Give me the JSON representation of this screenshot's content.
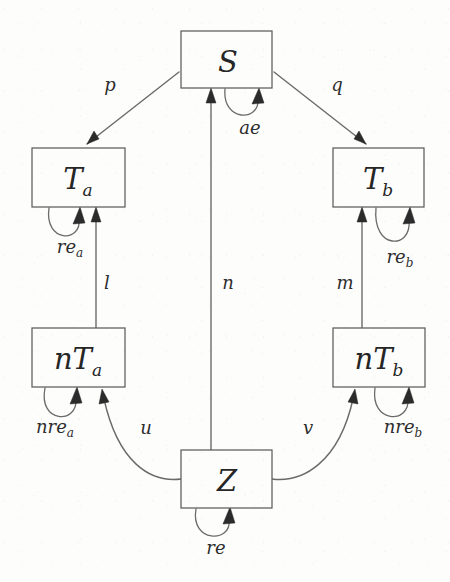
{
  "figure": {
    "kind": "state-transition-diagram",
    "background_color": "#fdfdfc",
    "line_color": "#6a6a6a",
    "arrow_color": "#2b2b2b",
    "text_color": "#262626",
    "width": 450,
    "height": 582
  },
  "nodes": [
    {
      "id": "S",
      "main": "S",
      "sub": "",
      "x": 181,
      "y": 31,
      "w": 91,
      "h": 57
    },
    {
      "id": "Ta",
      "main": "T",
      "sub": "a",
      "x": 32,
      "y": 148,
      "w": 93,
      "h": 59
    },
    {
      "id": "Tb",
      "main": "T",
      "sub": "b",
      "x": 333,
      "y": 148,
      "w": 91,
      "h": 59
    },
    {
      "id": "nTa",
      "main": "nT",
      "sub": "a",
      "x": 32,
      "y": 328,
      "w": 93,
      "h": 59
    },
    {
      "id": "nTb",
      "main": "nT",
      "sub": "b",
      "x": 333,
      "y": 328,
      "w": 92,
      "h": 59
    },
    {
      "id": "Z",
      "main": "Z",
      "sub": "",
      "x": 181,
      "y": 450,
      "w": 91,
      "h": 58
    }
  ],
  "edges": [
    {
      "id": "p",
      "label": "p",
      "sub": "",
      "from": "S",
      "to": "Ta",
      "style": "straight",
      "label_x": 110,
      "label_y": 91
    },
    {
      "id": "q",
      "label": "q",
      "sub": "",
      "from": "S",
      "to": "Tb",
      "style": "straight",
      "label_x": 337,
      "label_y": 91
    },
    {
      "id": "n",
      "label": "n",
      "sub": "",
      "from": "Z",
      "to": "S",
      "style": "straight",
      "label_x": 228,
      "label_y": 289
    },
    {
      "id": "l",
      "label": "l",
      "sub": "",
      "from": "nTa",
      "to": "Ta",
      "style": "straight",
      "label_x": 107,
      "label_y": 289
    },
    {
      "id": "m",
      "label": "m",
      "sub": "",
      "from": "nTb",
      "to": "Tb",
      "style": "straight",
      "label_x": 345,
      "label_y": 289
    },
    {
      "id": "u",
      "label": "u",
      "sub": "",
      "from": "Z",
      "to": "nTa",
      "style": "curved",
      "label_x": 146,
      "label_y": 434
    },
    {
      "id": "v",
      "label": "v",
      "sub": "",
      "from": "Z",
      "to": "nTb",
      "style": "curved",
      "label_x": 308,
      "label_y": 434
    }
  ],
  "self_loops": [
    {
      "id": "ae",
      "on": "S",
      "label": "ae",
      "sub": "",
      "label_x": 250,
      "label_y": 134
    },
    {
      "id": "rea",
      "on": "Ta",
      "label": "re",
      "sub": "a",
      "label_x": 70,
      "label_y": 253
    },
    {
      "id": "reb",
      "on": "Tb",
      "label": "re",
      "sub": "b",
      "label_x": 400,
      "label_y": 263
    },
    {
      "id": "nrea",
      "on": "nTa",
      "label": "nre",
      "sub": "a",
      "label_x": 55,
      "label_y": 433
    },
    {
      "id": "nreb",
      "on": "nTb",
      "label": "nre",
      "sub": "b",
      "label_x": 403,
      "label_y": 433
    },
    {
      "id": "re",
      "on": "Z",
      "label": "re",
      "sub": "",
      "label_x": 216,
      "label_y": 554
    }
  ]
}
